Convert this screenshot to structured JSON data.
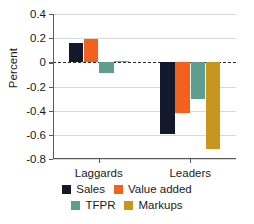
{
  "chart_data": {
    "type": "bar",
    "title": "",
    "xlabel": "",
    "ylabel": "Percent",
    "categories": [
      "Laggards",
      "Leaders"
    ],
    "series": [
      {
        "name": "Sales",
        "color": "#13182a",
        "values": [
          0.16,
          -0.59
        ]
      },
      {
        "name": "Value added",
        "color": "#f4611f",
        "values": [
          0.19,
          -0.42
        ]
      },
      {
        "name": "TFPR",
        "color": "#5f9e8f",
        "values": [
          -0.09,
          -0.3
        ]
      },
      {
        "name": "Markups",
        "color": "#c8961f",
        "values": [
          0.01,
          -0.72
        ]
      }
    ],
    "ylim": [
      -0.8,
      0.4
    ],
    "yticks": [
      0.4,
      0.2,
      0,
      -0.2,
      -0.4,
      -0.6,
      -0.8
    ],
    "ytick_labels": [
      "0.4",
      "0.2",
      "0",
      "-0.2",
      "-0.4",
      "-0.6",
      "-0.8"
    ],
    "grid": true,
    "zero_line": true,
    "legend_position": "bottom"
  },
  "legend": {
    "rows": [
      [
        {
          "label": "Sales",
          "color": "#13182a"
        },
        {
          "label": "Value added",
          "color": "#f4611f"
        }
      ],
      [
        {
          "label": "TFPR",
          "color": "#5f9e8f"
        },
        {
          "label": "Markups",
          "color": "#c8961f"
        }
      ]
    ]
  }
}
